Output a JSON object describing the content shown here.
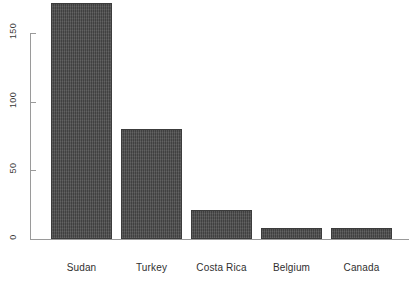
{
  "chart_data": {
    "type": "bar",
    "title": "",
    "subtitle": "",
    "xlabel": "",
    "ylabel": "",
    "categories": [
      "Sudan",
      "Turkey",
      "Costa Rica",
      "Belgium",
      "Canada"
    ],
    "values": [
      172,
      80,
      21,
      8,
      8
    ],
    "yticks": [
      0,
      50,
      100,
      150
    ],
    "ytick_labels": [
      "0",
      "50",
      "100",
      "150"
    ],
    "ylim": [
      0,
      176
    ],
    "grid": false,
    "legend": null,
    "bar_color": "#4b4b4b",
    "bar_edge_color": "#3c3c3c",
    "axis_color": "#9a9a9a",
    "tick_label_rotation": 90,
    "annotations": []
  },
  "caption": {
    "text": "",
    "note": "clipped at bottom edge"
  }
}
